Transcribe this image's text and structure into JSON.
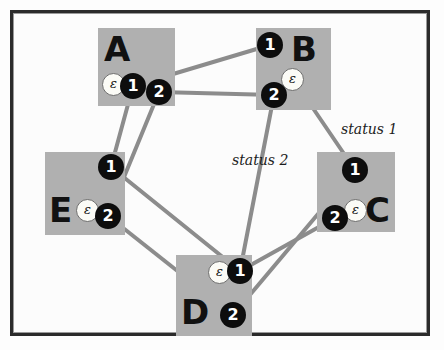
{
  "diagram": {
    "frame": {
      "border_color": "#2b2b2b",
      "background": "#fcfcfc"
    },
    "colors": {
      "node_box": "#b0b0b0",
      "port_fill": "#0d0d0d",
      "port_text": "#ffffff",
      "epsilon_fill": "#fbfbf6",
      "edge": "#8c8c8c",
      "label_text": "#1b1b1b"
    },
    "nodes": [
      {
        "id": "A",
        "label": "A",
        "box": {
          "x": 98,
          "y": 28,
          "w": 77,
          "h": 78
        },
        "letter_pos": {
          "x": 104,
          "y": 32
        },
        "epsilon": {
          "symbol": "ε",
          "x": 102,
          "y": 73
        },
        "ports": [
          {
            "label": "1",
            "x": 121,
            "y": 74
          },
          {
            "label": "2",
            "x": 147,
            "y": 80
          }
        ]
      },
      {
        "id": "B",
        "label": "B",
        "box": {
          "x": 256,
          "y": 28,
          "w": 75,
          "h": 82
        },
        "letter_pos": {
          "x": 291,
          "y": 32
        },
        "epsilon": {
          "symbol": "ε",
          "x": 281,
          "y": 68
        },
        "ports": [
          {
            "label": "1",
            "x": 258,
            "y": 33
          },
          {
            "label": "2",
            "x": 262,
            "y": 83
          }
        ]
      },
      {
        "id": "C",
        "label": "C",
        "box": {
          "x": 317,
          "y": 152,
          "w": 78,
          "h": 80
        },
        "letter_pos": {
          "x": 365,
          "y": 193
        },
        "epsilon": {
          "symbol": "ε",
          "x": 344,
          "y": 199
        },
        "ports": [
          {
            "label": "1",
            "x": 343,
            "y": 158
          },
          {
            "label": "2",
            "x": 323,
            "y": 206
          }
        ]
      },
      {
        "id": "D",
        "label": "D",
        "box": {
          "x": 176,
          "y": 255,
          "w": 76,
          "h": 81
        },
        "letter_pos": {
          "x": 181,
          "y": 295
        },
        "epsilon": {
          "symbol": "ε",
          "x": 208,
          "y": 261
        },
        "ports": [
          {
            "label": "1",
            "x": 228,
            "y": 259
          },
          {
            "label": "2",
            "x": 221,
            "y": 303
          }
        ]
      },
      {
        "id": "E",
        "label": "E",
        "box": {
          "x": 45,
          "y": 152,
          "w": 80,
          "h": 83
        },
        "letter_pos": {
          "x": 49,
          "y": 193
        },
        "epsilon": {
          "symbol": "ε",
          "x": 76,
          "y": 199
        },
        "ports": [
          {
            "label": "1",
            "x": 99,
            "y": 155
          },
          {
            "label": "2",
            "x": 96,
            "y": 204
          }
        ]
      }
    ],
    "edges": [
      {
        "id": "A1-B1",
        "from": "A.1",
        "to": "B.1",
        "x1": 133,
        "y1": 86,
        "x2": 270,
        "y2": 45
      },
      {
        "id": "A2-B2",
        "from": "A.2",
        "to": "B.2",
        "x1": 159,
        "y1": 92,
        "x2": 274,
        "y2": 95
      },
      {
        "id": "A1-E1",
        "from": "A.1",
        "to": "E.1",
        "x1": 133,
        "y1": 86,
        "x2": 111,
        "y2": 167
      },
      {
        "id": "A2-E2",
        "from": "A.2",
        "to": "E.2",
        "x1": 159,
        "y1": 92,
        "x2": 108,
        "y2": 216
      },
      {
        "id": "B1-C1",
        "from": "B.1",
        "to": "C.1",
        "x1": 270,
        "y1": 45,
        "x2": 355,
        "y2": 170
      },
      {
        "id": "B2-D1",
        "from": "B.2",
        "to": "D.1",
        "x1": 274,
        "y1": 95,
        "x2": 240,
        "y2": 271
      },
      {
        "id": "E1-D1",
        "from": "E.1",
        "to": "D.1",
        "x1": 111,
        "y1": 167,
        "x2": 240,
        "y2": 271
      },
      {
        "id": "E2-D2",
        "from": "E.2",
        "to": "D.2",
        "x1": 108,
        "y1": 216,
        "x2": 233,
        "y2": 315
      },
      {
        "id": "D1-C2",
        "from": "D.1",
        "to": "C.2",
        "x1": 240,
        "y1": 271,
        "x2": 335,
        "y2": 218
      },
      {
        "id": "D2-C1",
        "from": "D.2",
        "to": "C.1",
        "x1": 233,
        "y1": 315,
        "x2": 355,
        "y2": 170
      }
    ],
    "annotations": [
      {
        "id": "status-1",
        "text": "status 1",
        "x": 341,
        "y": 121
      },
      {
        "id": "status-2",
        "text": "status 2",
        "x": 232,
        "y": 152
      }
    ]
  }
}
